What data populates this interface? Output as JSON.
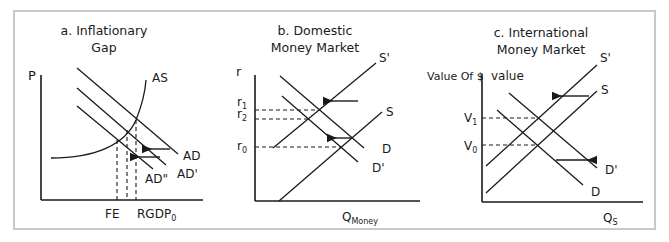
{
  "frame": {
    "x": 14,
    "y": 11,
    "w": 641,
    "h": 218,
    "stroke": "#c8c8c8",
    "stroke_width": 2
  },
  "style": {
    "line_color": "#1a1a1a",
    "line_width": 1.3,
    "dash": "4 3"
  },
  "panels": [
    {
      "id": "a",
      "title_lines": [
        "a. Inflationary",
        "Gap"
      ],
      "title_pos": [
        {
          "x": 104,
          "y": 35
        },
        {
          "x": 104,
          "y": 52
        }
      ],
      "axes": {
        "origin": [
          41,
          200
        ],
        "y_top": 75,
        "x_right": 203
      },
      "y_axis_label": {
        "text": "P",
        "x": 28,
        "y": 80
      },
      "curves": [
        {
          "name": "AS",
          "type": "curve",
          "path": "M51,158 C95,158 125,145 136,120 C142,105 145,95 146,80",
          "label": {
            "text": "AS",
            "x": 152,
            "y": 82
          }
        },
        {
          "name": "AD",
          "type": "line",
          "points": [
            [
              77,
              68
            ],
            [
              178,
              154
            ]
          ],
          "label": {
            "text": "AD",
            "x": 183,
            "y": 160
          }
        },
        {
          "name": "AD'",
          "type": "line",
          "points": [
            [
              77,
              88
            ],
            [
              166,
              165
            ]
          ],
          "label": {
            "text": "AD'",
            "x": 177,
            "y": 178
          }
        },
        {
          "name": "AD''",
          "type": "line",
          "points": [
            [
              77,
              106
            ],
            [
              153,
              169
            ]
          ],
          "label": {
            "text": "AD''",
            "x": 145,
            "y": 183
          }
        }
      ],
      "dashed": [
        {
          "points": [
            [
              117,
              140
            ],
            [
              117,
              200
            ]
          ]
        },
        {
          "points": [
            [
              127,
              130
            ],
            [
              127,
              200
            ]
          ]
        },
        {
          "points": [
            [
              136,
              120
            ],
            [
              136,
              200
            ]
          ]
        }
      ],
      "arrows": [
        {
          "from": [
            170,
            149
          ],
          "to": [
            150,
            149
          ]
        },
        {
          "from": [
            160,
            157
          ],
          "to": [
            138,
            157
          ]
        }
      ],
      "tick_labels": [
        {
          "text": "FE",
          "sub": "",
          "x": 105,
          "y": 218
        },
        {
          "text": "RGDP",
          "sub": "0",
          "x": 137,
          "y": 218
        }
      ]
    },
    {
      "id": "b",
      "title_lines": [
        "b. Domestic",
        "Money Market"
      ],
      "title_pos": [
        {
          "x": 315,
          "y": 35
        },
        {
          "x": 315,
          "y": 52
        }
      ],
      "axes": {
        "origin": [
          255,
          201
        ],
        "y_top": 75,
        "x_right": 420
      },
      "y_axis_label": {
        "text": "r",
        "x": 236,
        "y": 76
      },
      "curves": [
        {
          "name": "S'",
          "type": "line",
          "points": [
            [
              273,
              148
            ],
            [
              376,
              63
            ]
          ],
          "label": {
            "text": "S'",
            "x": 379,
            "y": 62
          }
        },
        {
          "name": "S",
          "type": "line",
          "points": [
            [
              279,
              201
            ],
            [
              382,
              112
            ]
          ],
          "label": {
            "text": "S",
            "x": 386,
            "y": 116
          }
        },
        {
          "name": "D",
          "type": "line",
          "points": [
            [
              280,
              76
            ],
            [
              364,
              148
            ]
          ],
          "label": {
            "text": "D",
            "x": 382,
            "y": 153
          }
        },
        {
          "name": "D'",
          "type": "line",
          "points": [
            [
              282,
              96
            ],
            [
              358,
              162
            ]
          ],
          "label": {
            "text": "D'",
            "x": 372,
            "y": 172
          }
        }
      ],
      "dashed": [
        {
          "points": [
            [
              255,
              110
            ],
            [
              320,
              110
            ]
          ]
        },
        {
          "points": [
            [
              255,
              119
            ],
            [
              309,
              119
            ]
          ]
        },
        {
          "points": [
            [
              255,
              147
            ],
            [
              341,
              147
            ]
          ]
        }
      ],
      "arrows": [
        {
          "from": [
            358,
            101
          ],
          "to": [
            331,
            101
          ]
        },
        {
          "from": [
            352,
            138
          ],
          "to": [
            335,
            138
          ]
        }
      ],
      "y_tick_labels": [
        {
          "text": "r",
          "sub": "1",
          "x": 237,
          "y": 106
        },
        {
          "text": "r",
          "sub": "2",
          "x": 237,
          "y": 118
        },
        {
          "text": "r",
          "sub": "0",
          "x": 237,
          "y": 150
        }
      ],
      "tick_labels": [
        {
          "text": "Q",
          "sub": "Money",
          "x": 342,
          "y": 221
        }
      ]
    },
    {
      "id": "c",
      "title_lines": [
        "c. International",
        "Money Market"
      ],
      "title_pos": [
        {
          "x": 541,
          "y": 37
        },
        {
          "x": 541,
          "y": 54
        }
      ],
      "axes": {
        "origin": [
          482,
          202
        ],
        "y_top": 74,
        "x_right": 643
      },
      "y_axis_label": {
        "text": "Value Of $",
        "x": 427,
        "y": 80
      },
      "y_axis_label2": {
        "text": "value",
        "x": 491,
        "y": 80
      },
      "curves": [
        {
          "name": "S'",
          "type": "line",
          "points": [
            [
              486,
              166
            ],
            [
              597,
              65
            ]
          ],
          "label": {
            "text": "S'",
            "x": 600,
            "y": 62
          }
        },
        {
          "name": "S",
          "type": "line",
          "points": [
            [
              486,
              193
            ],
            [
              597,
              91
            ]
          ],
          "label": {
            "text": "S",
            "x": 601,
            "y": 94
          }
        },
        {
          "name": "D'",
          "type": "line",
          "points": [
            [
              509,
              93
            ],
            [
              597,
              168
            ]
          ],
          "label": {
            "text": "D'",
            "x": 605,
            "y": 174
          }
        },
        {
          "name": "D",
          "type": "line",
          "points": [
            [
              497,
              110
            ],
            [
              583,
              185
            ]
          ],
          "label": {
            "text": "D",
            "x": 591,
            "y": 196
          }
        }
      ],
      "dashed": [
        {
          "points": [
            [
              482,
              118
            ],
            [
              538,
              118
            ]
          ]
        },
        {
          "points": [
            [
              482,
              145
            ],
            [
              538,
              145
            ]
          ]
        }
      ],
      "arrows": [
        {
          "from": [
            589,
            96
          ],
          "to": [
            560,
            96
          ]
        },
        {
          "from": [
            556,
            160
          ],
          "to": [
            589,
            160
          ]
        }
      ],
      "y_tick_labels": [
        {
          "text": "V",
          "sub": "1",
          "x": 464,
          "y": 122
        },
        {
          "text": "V",
          "sub": "0",
          "x": 464,
          "y": 150
        }
      ],
      "tick_labels": [
        {
          "text": "Q",
          "sub": "S",
          "x": 603,
          "y": 222
        }
      ]
    }
  ]
}
